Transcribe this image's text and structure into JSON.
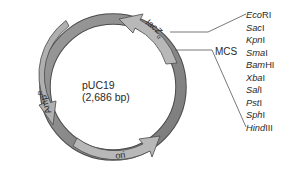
{
  "plasmid": {
    "name": "pUC19",
    "size": "(2,686 bp)"
  },
  "features": {
    "lacz": {
      "label": "lacZ",
      "subscript": "α"
    },
    "ampr": {
      "label": "Amp",
      "superscript": "R"
    },
    "ori": {
      "label": "ori"
    }
  },
  "mcs": {
    "label": "MCS",
    "enzymes": [
      {
        "italic": "Eco",
        "roman": "RI"
      },
      {
        "italic": "Sac",
        "roman": "I"
      },
      {
        "italic": "Kpn",
        "roman": "I"
      },
      {
        "italic": "Sma",
        "roman": "I"
      },
      {
        "italic": "Bam",
        "roman": "HI"
      },
      {
        "italic": "Xba",
        "roman": "I"
      },
      {
        "italic": "Sal",
        "roman": "I"
      },
      {
        "italic": "Pst",
        "roman": "I"
      },
      {
        "italic": "Sph",
        "roman": "I"
      },
      {
        "italic": "Hind",
        "roman": "III"
      }
    ]
  },
  "colors": {
    "backbone": "#8c8c8c",
    "backbone_dark": "#6f6f6f",
    "feature": "#b4b4b4",
    "outline": "#4a4a4a",
    "text": "#2a2a2a",
    "leader_line": "#555555"
  }
}
